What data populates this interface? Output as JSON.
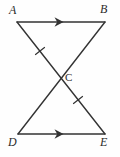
{
  "figure": {
    "type": "geometry-diagram",
    "background_color": "#fefefe",
    "stroke_color": "#333333",
    "label_color": "#2b2b2b",
    "width": 120,
    "height": 157,
    "points": [
      {
        "name": "A",
        "label": "A",
        "x": 17,
        "y": 22,
        "label_x": 9,
        "label_y": 4
      },
      {
        "name": "B",
        "label": "B",
        "x": 105,
        "y": 22,
        "label_x": 100,
        "label_y": 3
      },
      {
        "name": "C",
        "label": "C",
        "x": 61,
        "y": 78,
        "label_x": 65,
        "label_y": 71
      },
      {
        "name": "D",
        "label": "D",
        "x": 18,
        "y": 134,
        "label_x": 8,
        "label_y": 136
      },
      {
        "name": "E",
        "label": "E",
        "x": 105,
        "y": 134,
        "label_x": 100,
        "label_y": 136
      }
    ],
    "segments": [
      {
        "name": "AB",
        "from": "A",
        "to": "B",
        "x1": 17,
        "y1": 22,
        "x2": 105,
        "y2": 22,
        "arrow": true
      },
      {
        "name": "DE",
        "from": "D",
        "to": "E",
        "x1": 18,
        "y1": 134,
        "x2": 105,
        "y2": 134,
        "arrow": true
      },
      {
        "name": "AE",
        "from": "A",
        "to": "E",
        "x1": 17,
        "y1": 22,
        "x2": 105,
        "y2": 134,
        "arrow": false
      },
      {
        "name": "BD",
        "from": "B",
        "to": "D",
        "x1": 105,
        "y1": 22,
        "x2": 18,
        "y2": 134,
        "arrow": false
      }
    ],
    "arrow_marks": [
      {
        "name": "arrow-on-AB",
        "on_segment": "AB",
        "x": 60,
        "y": 22,
        "direction": "right"
      },
      {
        "name": "arrow-on-DE",
        "on_segment": "DE",
        "x": 60,
        "y": 134,
        "direction": "right"
      }
    ],
    "tick_marks": [
      {
        "name": "tick-on-AC",
        "on_segment": "AE",
        "x": 40,
        "y": 51,
        "count": 1
      },
      {
        "name": "tick-on-CE",
        "on_segment": "AE",
        "x": 78,
        "y": 100,
        "count": 1
      }
    ],
    "notes": {
      "parallel_pair": "AB and DE",
      "congruent_pair": "AC and CE"
    }
  }
}
